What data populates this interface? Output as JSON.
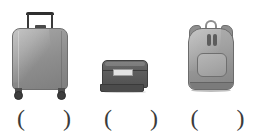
{
  "page": {
    "background_color": "#ffffff",
    "ink_color": "#3b3b3b"
  },
  "answer_marks": {
    "open_paren": "(",
    "close_paren": ")"
  },
  "items": [
    {
      "id": "item-1",
      "icon_name": "rolling-suitcase-icon",
      "label": "rolling suitcase",
      "answer": "",
      "colors": {
        "body": "#8d8d8d",
        "outline": "#6f6f6f",
        "handle": "#2f2f2f",
        "wheel": "#3d3d3d"
      }
    },
    {
      "id": "item-2",
      "icon_name": "train-case-icon",
      "label": "train case",
      "answer": "",
      "colors": {
        "body": "#5e5e5e",
        "outline": "#3f3f3f",
        "plate": "#e2e2e2",
        "skirt": "#4b4b4b"
      }
    },
    {
      "id": "item-3",
      "icon_name": "backpack-icon",
      "label": "backpack",
      "answer": "",
      "colors": {
        "body": "#a2a2a2",
        "outline": "#6b6b6b",
        "pocket": "#a6a6a6",
        "strap": "#8f8f8f"
      }
    }
  ]
}
